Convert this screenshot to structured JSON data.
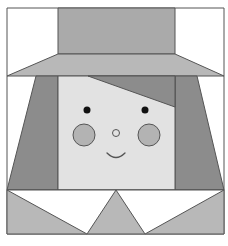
{
  "illustration": {
    "subject": "girl-with-hat-quilt-block",
    "colors": {
      "background": "#ffffff",
      "outline": "#555555",
      "hat_crown": "#aaaaaa",
      "hat_brim": "#b8b8b8",
      "hair": "#8c8c8c",
      "face": "#e2e2e2",
      "cheek": "#b3b3b3",
      "eye": "#111111",
      "dress": "#b8b8b8",
      "collar": "#ffffff"
    }
  }
}
